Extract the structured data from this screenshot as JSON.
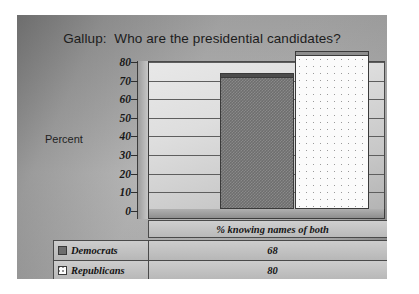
{
  "slide": {
    "title": "Gallup:  Who are the presidential candidates?",
    "axis_caption": "Percent"
  },
  "chart_data": {
    "type": "bar",
    "title": "Gallup:  Who are the presidential candidates?",
    "xlabel": "",
    "ylabel": "Percent",
    "categories": [
      "% knowing names of both"
    ],
    "series": [
      {
        "name": "Democrats",
        "values": [
          68
        ],
        "swatch": "dark-gray-checkered"
      },
      {
        "name": "Republicans",
        "values": [
          80
        ],
        "swatch": "white-dotted"
      }
    ],
    "ylim": [
      0,
      80
    ],
    "yticks": [
      "80",
      "70",
      "60",
      "50",
      "40",
      "30",
      "20",
      "10",
      "0"
    ],
    "ytick_values": [
      80,
      70,
      60,
      50,
      40,
      30,
      20,
      10,
      0
    ],
    "grid": true,
    "legend": "data-table",
    "style": "3d-perspective"
  },
  "table": {
    "category_header": "% knowing names of both",
    "rows": [
      {
        "label": "Democrats",
        "value": "68"
      },
      {
        "label": "Republicans",
        "value": "80"
      }
    ]
  },
  "colors": {
    "democrats": "#6e6e6e",
    "republicans": "#fbfbfb",
    "axis": "#2e2e2e",
    "text": "#161616"
  }
}
